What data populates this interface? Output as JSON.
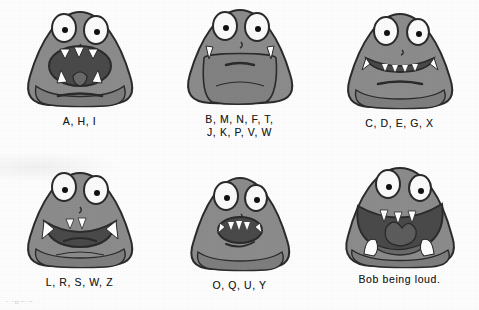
{
  "figure": {
    "title_visible": false,
    "background_color": "#ffffff",
    "body_color": "#8c8c8c",
    "body_shadow_color": "#6f6f6f",
    "outline_color": "#2b2b2b",
    "mouth_color": "#4a4a4a",
    "throat_color": "#555555",
    "tooth_color": "#ffffff",
    "eye_white": "#fbfbfb",
    "pupil_color": "#111111",
    "caption_color": "#1d1d1d"
  },
  "cells": [
    {
      "id": "cell-a-h-i",
      "caption": "A, H, I",
      "mouth": "wide-open-round",
      "name": "mouth-shape-a-h-i"
    },
    {
      "id": "cell-b-m-n-f-t-j-k-p-v-w",
      "caption": "B, M, N, F, T,\nJ, K, P, V, W",
      "mouth": "closed-line",
      "name": "mouth-shape-b-m-n-f-t-j-k-p-v-w"
    },
    {
      "id": "cell-c-d-e-g-x",
      "caption": "C, D, E, G, X",
      "mouth": "wide-grin-teeth",
      "name": "mouth-shape-c-d-e-g-x"
    },
    {
      "id": "cell-l-r-s-w-z",
      "caption": "L, R, S, W, Z",
      "mouth": "open-teeth-bared",
      "name": "mouth-shape-l-r-s-w-z"
    },
    {
      "id": "cell-o-q-u-y",
      "caption": "O, Q, U, Y",
      "mouth": "small-round-open",
      "name": "mouth-shape-o-q-u-y"
    },
    {
      "id": "cell-bob-loud",
      "caption": "Bob being loud.",
      "mouth": "huge-gaping-shout",
      "name": "mouth-shape-bob-being-loud"
    }
  ],
  "footer": {
    "clipped_text": "Figure"
  }
}
